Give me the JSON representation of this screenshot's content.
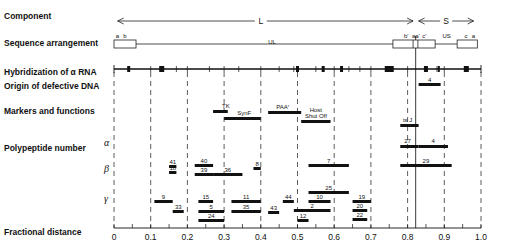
{
  "row_labels": {
    "component": "Component",
    "sequence": "Sequence arrangement",
    "hybridization": "Hybridization of α RNA",
    "origin": "Origin of defective DNA",
    "markers": "Markers and functions",
    "polypeptide": "Polypeptide number",
    "fractional": "Fractional distance"
  },
  "greek_labels": {
    "alpha": "α",
    "beta": "β",
    "gamma": "γ"
  },
  "component": {
    "L": "L",
    "S": "S"
  },
  "sequence": {
    "a": "a",
    "b": "b",
    "UL": "UL",
    "b_prime": "b'",
    "a_prime": "aa'",
    "c_prime": "c'",
    "US": "US",
    "c": "c",
    "a_end": "a"
  },
  "axis": {
    "ticks": [
      "0",
      "0.1",
      "0.2",
      "0.3",
      "0.4",
      "0.5",
      "0.6",
      "0.7",
      "0.8",
      "0.9",
      "1.0"
    ]
  },
  "chart_data": {
    "type": "diagram",
    "xlabel": "Fractional distance",
    "xlim": [
      0,
      1.0
    ],
    "component_regions": [
      {
        "name": "L",
        "range": [
          0,
          0.82
        ]
      },
      {
        "name": "S",
        "range": [
          0.83,
          1.0
        ]
      }
    ],
    "hybridization_blocks": [
      0.04,
      0.13,
      0.5,
      0.57,
      0.62,
      0.75,
      0.85,
      0.89,
      0.96
    ],
    "origin_defective_dna": [
      {
        "label": "4",
        "range": [
          0.83,
          0.89
        ]
      }
    ],
    "markers": [
      {
        "label": "TK",
        "range": [
          0.27,
          0.31
        ]
      },
      {
        "label": "SynF",
        "range": [
          0.3,
          0.4
        ]
      },
      {
        "label": "PAAr",
        "range": [
          0.42,
          0.51
        ]
      },
      {
        "label": "Host Shut Off",
        "range": [
          0.51,
          0.59
        ]
      },
      {
        "label": "ts J",
        "range": [
          0.78,
          0.83
        ]
      }
    ],
    "polypeptides": {
      "alpha": [
        {
          "label": "27",
          "range": [
            0.78,
            0.83
          ]
        },
        {
          "label": "4",
          "range": [
            0.83,
            0.91
          ]
        }
      ],
      "beta": [
        {
          "label": "41",
          "range": [
            0.15,
            0.17
          ]
        },
        {
          "label": "18",
          "range": [
            0.15,
            0.17
          ]
        },
        {
          "label": "40",
          "range": [
            0.22,
            0.27
          ]
        },
        {
          "label": "39",
          "range": [
            0.22,
            0.27
          ]
        },
        {
          "label": "36",
          "range": [
            0.27,
            0.35
          ]
        },
        {
          "label": "8",
          "range": [
            0.38,
            0.4
          ]
        },
        {
          "label": "7",
          "range": [
            0.53,
            0.64
          ]
        },
        {
          "label": "29",
          "range": [
            0.78,
            0.92
          ]
        }
      ],
      "gamma": [
        {
          "label": "9",
          "range": [
            0.11,
            0.16
          ]
        },
        {
          "label": "33",
          "range": [
            0.16,
            0.19
          ]
        },
        {
          "label": "15",
          "range": [
            0.23,
            0.27
          ]
        },
        {
          "label": "5",
          "range": [
            0.23,
            0.3
          ]
        },
        {
          "label": "24",
          "range": [
            0.23,
            0.3
          ]
        },
        {
          "label": "11",
          "range": [
            0.32,
            0.4
          ]
        },
        {
          "label": "35",
          "range": [
            0.32,
            0.4
          ]
        },
        {
          "label": "44",
          "range": [
            0.46,
            0.49
          ]
        },
        {
          "label": "43",
          "range": [
            0.42,
            0.45
          ]
        },
        {
          "label": "25",
          "range": [
            0.53,
            0.64
          ]
        },
        {
          "label": "10",
          "range": [
            0.53,
            0.59
          ]
        },
        {
          "label": "2",
          "range": [
            0.49,
            0.59
          ]
        },
        {
          "label": "12",
          "range": [
            0.5,
            0.53
          ]
        },
        {
          "label": "19",
          "range": [
            0.65,
            0.7
          ]
        },
        {
          "label": "20",
          "range": [
            0.65,
            0.69
          ]
        },
        {
          "label": "22",
          "range": [
            0.65,
            0.69
          ]
        }
      ]
    }
  }
}
